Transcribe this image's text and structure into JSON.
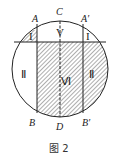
{
  "diagram": {
    "points": {
      "A": "A",
      "A_prime": "A′",
      "B": "B",
      "B_prime": "B′",
      "C": "C",
      "D": "D"
    },
    "regions": {
      "I_left": "I",
      "I_right": "I",
      "II_left": "Ⅱ",
      "II_right": "Ⅱ",
      "V": "V",
      "VI": "Ⅵ"
    },
    "caption": "图 2",
    "colors": {
      "stroke": "#222222",
      "hatch": "#333333",
      "background": "#ffffff"
    }
  }
}
